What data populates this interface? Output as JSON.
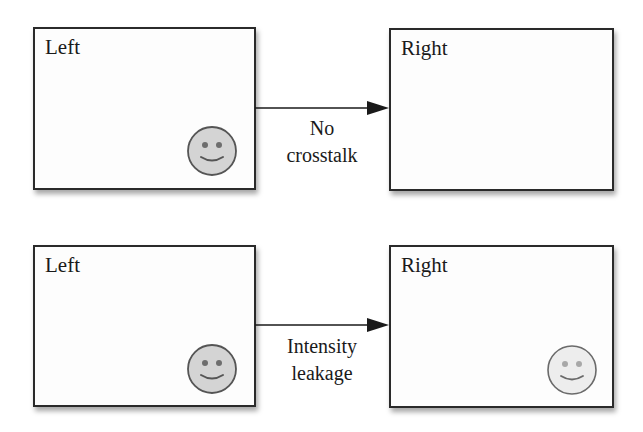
{
  "diagram": {
    "rows": [
      {
        "name": "no-crosstalk",
        "left_panel": {
          "label": "Left",
          "smiley_visible": true,
          "smiley_fill": "#d4d4d4",
          "smiley_stroke": "#555555"
        },
        "right_panel": {
          "label": "Right",
          "smiley_visible": false
        },
        "connector": {
          "line1": "No",
          "line2": "crosstalk"
        }
      },
      {
        "name": "intensity-leakage",
        "left_panel": {
          "label": "Left",
          "smiley_visible": true,
          "smiley_fill": "#d4d4d4",
          "smiley_stroke": "#555555"
        },
        "right_panel": {
          "label": "Right",
          "smiley_visible": true,
          "smiley_fill": "#ededed",
          "smiley_stroke": "#6a6a6a"
        },
        "connector": {
          "line1": "Intensity",
          "line2": "leakage"
        }
      }
    ],
    "colors": {
      "panel_border": "#2a2a2a",
      "arrow": "#1a1a1a",
      "text": "#1a1a1a"
    }
  }
}
